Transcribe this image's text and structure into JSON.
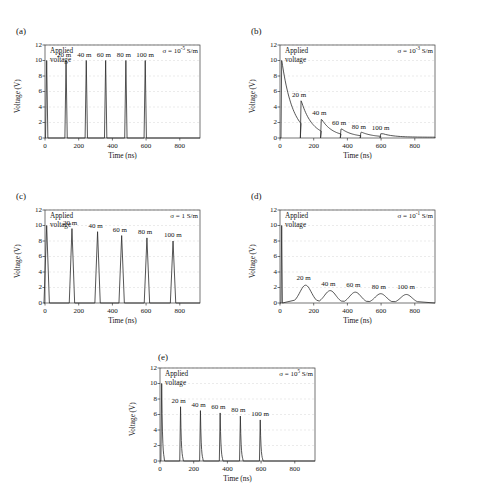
{
  "figure": {
    "axis_xlabel": "Time (ns)",
    "axis_ylabel": "Voltage (V)",
    "applied_line1": "Applied",
    "applied_line2": "voltage",
    "yticks": [
      "0",
      "2",
      "4",
      "6",
      "8",
      "10",
      "12"
    ],
    "xticks": [
      "0",
      "200",
      "400",
      "600",
      "800"
    ],
    "trace_labels": [
      "20 m",
      "40 m",
      "60 m",
      "80 m",
      "100 m"
    ],
    "axis_color": "#3a3a3a",
    "trace_color": "#2b2b2b",
    "grid_color": "#d7d7d7"
  },
  "chart_data": [
    {
      "type": "line",
      "panel": "(a)",
      "sigma_label": "σ = 10⁻⁵ S/m",
      "sigma_prefix": "σ = 10",
      "sigma_exponent": "-5",
      "sigma_suffix": " S/m",
      "title": "",
      "xlabel": "Time (ns)",
      "ylabel": "Voltage (V)",
      "xlim": [
        0,
        920
      ],
      "ylim": [
        0,
        12
      ],
      "grid": true,
      "legend_position": "inline-annotations",
      "applied_voltage": 10,
      "peak_times": [
        10,
        125,
        245,
        360,
        480,
        595
      ],
      "peak_values": [
        10.0,
        10.0,
        10.0,
        10.0,
        10.0,
        10.0
      ],
      "peak_width_ns": 7,
      "decay_ns": 0,
      "shape": "narrow-spike",
      "annotations": [
        {
          "label": "20 m",
          "x": 125,
          "y": 10.0
        },
        {
          "label": "40 m",
          "x": 245,
          "y": 10.0
        },
        {
          "label": "60 m",
          "x": 360,
          "y": 10.0
        },
        {
          "label": "80 m",
          "x": 480,
          "y": 10.0
        },
        {
          "label": "100 m",
          "x": 595,
          "y": 10.0
        }
      ]
    },
    {
      "type": "line",
      "panel": "(b)",
      "sigma_label": "σ = 10⁻³ S/m",
      "sigma_prefix": "σ = 10",
      "sigma_exponent": "-3",
      "sigma_suffix": " S/m",
      "title": "",
      "xlabel": "Time (ns)",
      "ylabel": "Voltage (V)",
      "xlim": [
        0,
        920
      ],
      "ylim": [
        0,
        12
      ],
      "grid": true,
      "legend_position": "inline-annotations",
      "applied_voltage": 10,
      "peak_times": [
        10,
        125,
        245,
        362,
        480,
        598
      ],
      "peak_values": [
        10.0,
        4.8,
        2.4,
        1.15,
        0.7,
        0.55
      ],
      "peak_width_ns": 6,
      "decay_ns": 120,
      "shape": "spike-with-exponential-tail",
      "annotations": [
        {
          "label": "20 m",
          "x": 125,
          "y": 4.8
        },
        {
          "label": "40 m",
          "x": 245,
          "y": 2.4
        },
        {
          "label": "60 m",
          "x": 362,
          "y": 1.15
        },
        {
          "label": "80 m",
          "x": 480,
          "y": 0.7
        },
        {
          "label": "100 m",
          "x": 598,
          "y": 0.55
        }
      ]
    },
    {
      "type": "line",
      "panel": "(c)",
      "sigma_label": "σ = 1 S/m",
      "sigma_prefix": "σ = 1 S/m",
      "sigma_exponent": "",
      "sigma_suffix": "",
      "title": "",
      "xlabel": "Time (ns)",
      "ylabel": "Voltage (V)",
      "xlim": [
        0,
        920
      ],
      "ylim": [
        0,
        12
      ],
      "grid": true,
      "legend_position": "inline-annotations",
      "applied_voltage": 10,
      "peak_times": [
        10,
        160,
        312,
        455,
        605,
        760
      ],
      "peak_values": [
        10.0,
        9.6,
        9.2,
        8.7,
        8.4,
        8.0
      ],
      "peak_width_ns": 16,
      "decay_ns": 0,
      "shape": "broad-spike",
      "annotations": [
        {
          "label": "20 m",
          "x": 160,
          "y": 9.6
        },
        {
          "label": "40 m",
          "x": 312,
          "y": 9.2
        },
        {
          "label": "60 m",
          "x": 455,
          "y": 8.7
        },
        {
          "label": "80 m",
          "x": 605,
          "y": 8.4
        },
        {
          "label": "100 m",
          "x": 760,
          "y": 8.0
        }
      ]
    },
    {
      "type": "line",
      "panel": "(d)",
      "sigma_label": "σ = 10⁻¹ S/m",
      "sigma_prefix": "σ = 10",
      "sigma_exponent": "-1",
      "sigma_suffix": " S/m",
      "title": "",
      "xlabel": "Time (ns)",
      "ylabel": "Voltage (V)",
      "xlim": [
        0,
        920
      ],
      "ylim": [
        0,
        12
      ],
      "grid": true,
      "legend_position": "inline-annotations",
      "applied_voltage": 10,
      "peak_times": [
        10,
        152,
        298,
        447,
        598,
        750
      ],
      "peak_values": [
        10.0,
        2.3,
        1.6,
        1.4,
        1.2,
        1.1
      ],
      "peak_width_ns": 65,
      "decay_ns": 0,
      "shape": "broad-hump",
      "annotations": [
        {
          "label": "20 m",
          "x": 152,
          "y": 2.3
        },
        {
          "label": "40 m",
          "x": 298,
          "y": 1.6
        },
        {
          "label": "60 m",
          "x": 447,
          "y": 1.4
        },
        {
          "label": "80 m",
          "x": 598,
          "y": 1.2
        },
        {
          "label": "100 m",
          "x": 750,
          "y": 1.1
        }
      ]
    },
    {
      "type": "line",
      "panel": "(e)",
      "sigma_label": "σ = 10⁵ S/m",
      "sigma_prefix": "σ = 10",
      "sigma_exponent": "5",
      "sigma_suffix": " S/m",
      "title": "",
      "xlabel": "Time (ns)",
      "ylabel": "Voltage (V)",
      "xlim": [
        0,
        920
      ],
      "ylim": [
        0,
        12
      ],
      "grid": true,
      "legend_position": "inline-annotations",
      "applied_voltage": 10,
      "peak_times": [
        10,
        122,
        240,
        357,
        477,
        595
      ],
      "peak_values": [
        10.0,
        7.0,
        6.5,
        6.2,
        5.8,
        5.3
      ],
      "peak_width_ns": 8,
      "decay_ns": 14,
      "shape": "narrow-spike-decaying",
      "annotations": [
        {
          "label": "20 m",
          "x": 122,
          "y": 7.0
        },
        {
          "label": "40 m",
          "x": 240,
          "y": 6.5
        },
        {
          "label": "60 m",
          "x": 357,
          "y": 6.2
        },
        {
          "label": "80 m",
          "x": 477,
          "y": 5.8
        },
        {
          "label": "100 m",
          "x": 595,
          "y": 5.3
        }
      ]
    }
  ]
}
